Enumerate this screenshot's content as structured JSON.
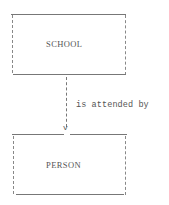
{
  "diagram": {
    "type": "entity-relationship",
    "entities": [
      {
        "id": "school",
        "label": "SCHOOL"
      },
      {
        "id": "person",
        "label": "PERSON"
      }
    ],
    "relationship": {
      "from": "school",
      "to": "person",
      "label": "is attended by",
      "arrow_glyph": "v"
    }
  }
}
